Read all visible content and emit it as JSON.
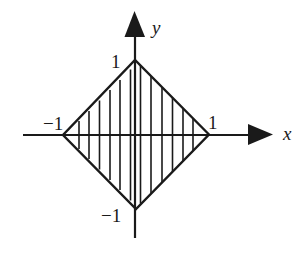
{
  "figure": {
    "stroke_color": "#1a1a1a",
    "background": "#ffffff"
  },
  "axes": {
    "x_label": "x",
    "y_label": "y"
  },
  "ticks": {
    "x_pos": "1",
    "x_neg": "−1",
    "y_pos": "1",
    "y_neg": "−1"
  },
  "region": {
    "vertices": [
      [
        1,
        0
      ],
      [
        0,
        1
      ],
      [
        -1,
        0
      ],
      [
        0,
        -1
      ]
    ],
    "fill": "vertical-hatching",
    "hatch_x_values": [
      -0.85,
      -0.64,
      -0.42,
      -0.2,
      -0.05,
      0.05,
      0.2,
      0.42,
      0.64,
      0.85
    ]
  }
}
